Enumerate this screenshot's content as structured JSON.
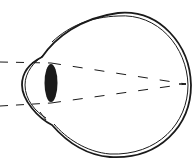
{
  "diagram": {
    "subject": "eye-cross-section",
    "depiction": "light rays entering eye through lens, focusing at or behind the retina (hyperopia / farsightedness illustration)",
    "colors": {
      "background": "#ffffff",
      "stroke": "#1a1a1a",
      "lens_fill": "#1a1a1a"
    },
    "elements": [
      {
        "id": "eyeball-outer-wall",
        "type": "double-outline"
      },
      {
        "id": "cornea",
        "type": "curved-front-bulge"
      },
      {
        "id": "lens",
        "type": "filled-ellipse"
      },
      {
        "id": "light-ray-upper",
        "type": "dashed-line"
      },
      {
        "id": "light-ray-lower",
        "type": "dashed-line"
      },
      {
        "id": "focal-point",
        "type": "convergence-at-retina"
      }
    ]
  }
}
